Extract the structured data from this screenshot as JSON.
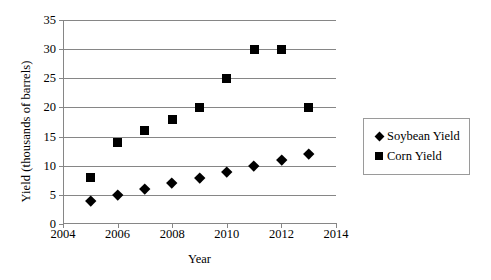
{
  "chart_data": {
    "type": "scatter",
    "title": "",
    "xlabel": "Year",
    "ylabel": "Yield (thousands of barrels)",
    "xlim": [
      2004,
      2014
    ],
    "ylim": [
      0,
      35
    ],
    "x_ticks": [
      "2004",
      "2006",
      "2008",
      "2010",
      "2012",
      "2014"
    ],
    "x_tick_values": [
      2004,
      2006,
      2008,
      2010,
      2012,
      2014
    ],
    "y_ticks": [
      "0",
      "5",
      "10",
      "15",
      "20",
      "25",
      "30",
      "35"
    ],
    "y_tick_values": [
      0,
      5,
      10,
      15,
      20,
      25,
      30,
      35
    ],
    "grid": "horizontal",
    "legend_position": "right",
    "x": [
      2005,
      2006,
      2007,
      2008,
      2009,
      2010,
      2011,
      2012,
      2013
    ],
    "series": [
      {
        "name": "Soybean Yield",
        "marker": "diamond",
        "color": "#000000",
        "values": [
          4,
          5,
          6,
          7,
          8,
          9,
          10,
          11,
          12
        ]
      },
      {
        "name": "Corn Yield",
        "marker": "square",
        "color": "#000000",
        "values": [
          8,
          14,
          16,
          18,
          20,
          25,
          30,
          30,
          20
        ]
      }
    ]
  },
  "legend": {
    "entries": [
      {
        "label": "Soybean Yield",
        "marker": "diamond-marker-icon"
      },
      {
        "label": "Corn Yield",
        "marker": "square-marker-icon"
      }
    ]
  },
  "axes": {
    "x_title": "Year",
    "y_title": "Yield (thousands of barrels)"
  },
  "colors": {
    "marker": "#000000",
    "gridline": "#868686",
    "axis": "#868686",
    "legend_border": "#9a9a9a",
    "background": "#ffffff"
  }
}
